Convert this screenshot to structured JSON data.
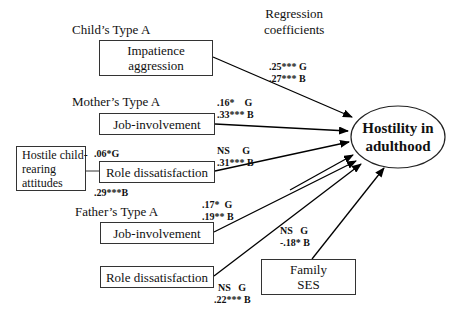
{
  "header": {
    "regression_label": "Regression\ncoefficients"
  },
  "groups": {
    "child": "Child’s Type A",
    "mother": "Mother’s Type A",
    "father": "Father’s Type A"
  },
  "boxes": {
    "child_impatience": "Impatience\naggression",
    "mother_job": "Job-involvement",
    "mother_role": "Role dissatisfaction",
    "hostile": "Hostile child-\nrearing\nattitudes",
    "father_job": "Job-involvement",
    "father_role": "Role dissatisfaction",
    "family_ses": "Family\nSES"
  },
  "outcome": "Hostility in\nadulthood",
  "coefficients": {
    "child_impatience": {
      "g": ".25*** G",
      "b": ".27*** B"
    },
    "mother_job": {
      "g": ".16*    G",
      "b": ".33*** B"
    },
    "mother_role": {
      "g": "NS     G",
      "b": ".31*** B"
    },
    "hostile_g": ".06*G",
    "hostile_b": ".29***B",
    "father_job": {
      "g": ".17*  G",
      "b": ".19** B"
    },
    "father_role": {
      "g": "NS   G",
      "b": ".22*** B"
    },
    "family_ses": {
      "g": "NS   G",
      "b": "-.18* B"
    }
  }
}
